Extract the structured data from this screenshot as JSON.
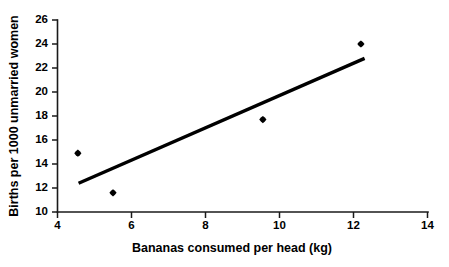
{
  "chart_data": {
    "type": "scatter",
    "title": "",
    "xlabel": "Bananas consumed per head (kg)",
    "ylabel": "Births per 1000 unmarried women",
    "xlim": [
      4,
      14
    ],
    "ylim": [
      10,
      26
    ],
    "xticks": [
      4,
      6,
      8,
      10,
      12,
      14
    ],
    "yticks": [
      10,
      12,
      14,
      16,
      18,
      20,
      22,
      24,
      26
    ],
    "xtick_labels": [
      "4",
      "6",
      "8",
      "10",
      "12",
      "14"
    ],
    "ytick_labels": [
      "10",
      "12",
      "14",
      "16",
      "18",
      "20",
      "22",
      "24",
      "26"
    ],
    "grid": false,
    "legend": false,
    "legend_position": "none",
    "marker": "diamond",
    "marker_color": "#000000",
    "line_color": "#000000",
    "points": [
      {
        "x": 4.55,
        "y": 14.9
      },
      {
        "x": 5.5,
        "y": 11.6
      },
      {
        "x": 9.55,
        "y": 17.7
      },
      {
        "x": 12.2,
        "y": 24.0
      }
    ],
    "series": [
      {
        "name": "observations",
        "x": [
          4.55,
          5.5,
          9.55,
          12.2
        ],
        "values": [
          14.9,
          11.6,
          17.7,
          24.0
        ]
      }
    ],
    "trend_line": {
      "name": "regression-line",
      "x_start": 4.57,
      "y_start": 12.4,
      "x_end": 12.3,
      "y_end": 22.8
    }
  }
}
